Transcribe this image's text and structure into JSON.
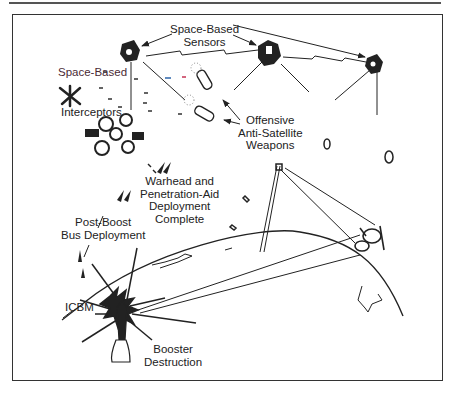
{
  "figure": {
    "type": "illustration",
    "labels": {
      "space_based_sensors": [
        "Space-Based",
        "Sensors"
      ],
      "space_based_interceptors": [
        "Space-Based",
        "Interceptors"
      ],
      "offensive_asat": [
        "Offensive",
        "Anti-Satellite",
        "Weapons"
      ],
      "warhead_deployment": [
        "Warhead and",
        "Penetration-Aid",
        "Deployment",
        "Complete"
      ],
      "post_boost": [
        "Post-Boost",
        "Bus Deployment"
      ],
      "icbm": "ICBM",
      "booster_destruction": [
        "Booster",
        "Destruction"
      ]
    },
    "colors": {
      "line": "#222222",
      "frame": "#333333",
      "dash_blue": "#3a6fb0",
      "dash_red": "#c84060",
      "label_tint": "#6a2a3a"
    }
  }
}
